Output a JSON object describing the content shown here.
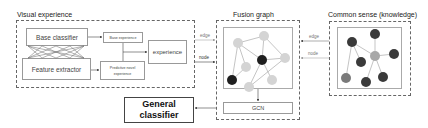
{
  "sections": {
    "visual_experience": {
      "title": "Visual experience",
      "base_classifier": "Base classifier",
      "feature_extractor": "Feature extractor",
      "base_experience": "Base experience",
      "predictive_novel_experience": "Predictive novel experience",
      "experience": "experience"
    },
    "fusion_graph": {
      "title": "Fusion graph",
      "gcn": "GCN"
    },
    "common_sense": {
      "title": "Common sense (knowledge)"
    }
  },
  "connectors": {
    "left_edge": "edge",
    "left_node": "node",
    "right_edge": "edge",
    "right_node": "node"
  },
  "output": {
    "general_classifier_line1": "General",
    "general_classifier_line2": "classifier"
  },
  "colors": {
    "dark_node": "#1f1f1f",
    "light_node": "#d4d4d4",
    "kg_dark_node": "#3a3a3a",
    "kg_center_node": "#a8a8a8",
    "kg_mid_node": "#7a7a7a",
    "edge_line": "#888888"
  }
}
